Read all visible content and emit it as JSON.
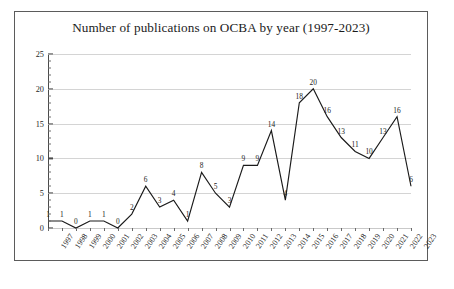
{
  "chart_data": {
    "type": "line",
    "title": "Number of publications on OCBA by year (1997-2023)",
    "xlabel": "",
    "ylabel": "",
    "ylim": [
      0,
      25
    ],
    "ytick_labels": [
      "0",
      "5",
      "10",
      "15",
      "20",
      "25"
    ],
    "ytick_values": [
      0,
      5,
      10,
      15,
      20,
      25
    ],
    "grid": "horizontal",
    "legend": "none",
    "line_color": "#1a1a1a",
    "categories": [
      "1997",
      "1998",
      "1999",
      "2000",
      "2001",
      "2002",
      "2003",
      "2004",
      "2005",
      "2006",
      "2007",
      "2008",
      "2009",
      "2010",
      "2011",
      "2012",
      "2013",
      "2014",
      "2015",
      "2016",
      "2017",
      "2018",
      "2019",
      "2020",
      "2021",
      "2022",
      "2023"
    ],
    "values": [
      1,
      1,
      0,
      1,
      1,
      0,
      2,
      6,
      3,
      4,
      1,
      8,
      5,
      3,
      9,
      9,
      14,
      4,
      18,
      20,
      16,
      13,
      11,
      10,
      13,
      16,
      6
    ],
    "data_labels": [
      "1",
      "1",
      "0",
      "1",
      "1",
      "0",
      "2",
      "6",
      "3",
      "4",
      "1",
      "8",
      "5",
      "3",
      "9",
      "9",
      "14",
      "4",
      "18",
      "20",
      "16",
      "13",
      "11",
      "10",
      "13",
      "16",
      "6"
    ]
  },
  "figure": {
    "border_color": "#5b5b5b",
    "background": "#ffffff"
  }
}
